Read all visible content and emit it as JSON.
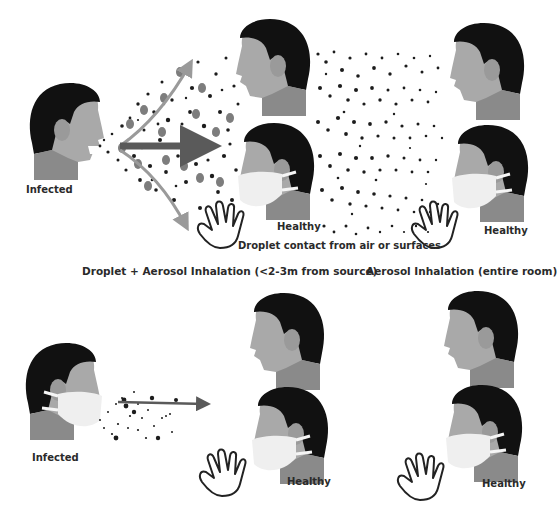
{
  "diagram": {
    "colors": {
      "hair": "#111111",
      "skin": "#a9a9a9",
      "neck": "#8a8a8a",
      "mask": "#efefef",
      "droplet_large": "#7d7d7d",
      "particle": "#1c1c1c",
      "arrow_main": "#5a5a5a",
      "arrow_side": "#9a9a9a",
      "text": "#2a2a2a"
    },
    "top_scenario": {
      "source_label": "Infected",
      "receivers": [
        {
          "position": "near-unmasked",
          "masked": false
        },
        {
          "position": "near-masked",
          "masked": true,
          "label": "Healthy"
        },
        {
          "position": "far-unmasked",
          "masked": false
        },
        {
          "position": "far-masked",
          "masked": true,
          "label": "Healthy"
        }
      ],
      "contact_caption": "Droplet contact from air or surfaces",
      "near_zone_caption": "Droplet + Aerosol Inhalation (<2-3m from source)",
      "far_zone_caption": "Aerosol Inhalation (entire room)"
    },
    "bottom_scenario": {
      "source_label": "Infected",
      "source_masked": true,
      "receivers": [
        {
          "position": "near-unmasked",
          "masked": false
        },
        {
          "position": "near-masked",
          "masked": true,
          "label": "Healthy"
        },
        {
          "position": "far-unmasked",
          "masked": false
        },
        {
          "position": "far-masked",
          "masked": true,
          "label": "Healthy"
        }
      ]
    },
    "icons": [
      "person-head-icon",
      "face-mask-icon",
      "hand-icon",
      "arrow-icon",
      "droplet-cloud"
    ]
  }
}
